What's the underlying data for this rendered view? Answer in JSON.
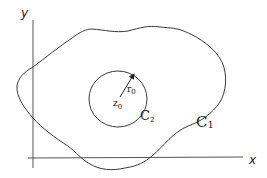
{
  "diagram": {
    "axes": {
      "x_label": "x",
      "y_label": "y"
    },
    "outer_curve": {
      "label_main": "C",
      "label_sub": "1"
    },
    "inner_circle": {
      "label_main": "C",
      "label_sub": "2"
    },
    "center_point": {
      "label_main": "z",
      "label_sub": "0"
    },
    "radius": {
      "label_main": "r",
      "label_sub": "0"
    },
    "colors": {
      "stroke": "#3a3a3a",
      "axis": "#555555",
      "background": "#ffffff"
    }
  }
}
